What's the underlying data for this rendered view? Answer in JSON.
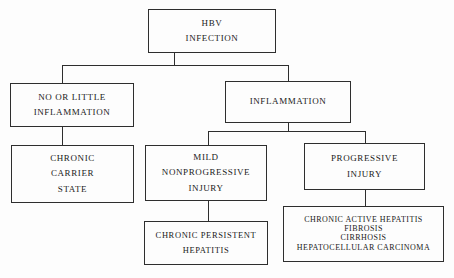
{
  "diagram": {
    "stroke_color": "#2e2e2e",
    "background_color": "#fdfdfd",
    "nodes": {
      "root": {
        "lines": [
          "HBV",
          "INFECTION"
        ]
      },
      "no_or_little_inflammation": {
        "lines": [
          "NO OR LITTLE",
          "INFLAMMATION"
        ]
      },
      "inflammation": {
        "lines": [
          "INFLAMMATION"
        ]
      },
      "chronic_carrier_state": {
        "lines": [
          "CHRONIC",
          "CARRIER",
          "STATE"
        ]
      },
      "mild_nonprogressive_injury": {
        "lines": [
          "MILD",
          "NONPROGRESSIVE",
          "INJURY"
        ]
      },
      "progressive_injury": {
        "lines": [
          "PROGRESSIVE",
          "INJURY"
        ]
      },
      "chronic_persistent_hepatitis": {
        "lines": [
          "CHRONIC PERSISTENT",
          "HEPATITIS"
        ]
      },
      "progressive_outcomes": {
        "lines": [
          "CHRONIC ACTIVE HEPATITIS",
          "FIBROSIS",
          "CIRRHOSIS",
          "HEPATOCELLULAR CARCINOMA"
        ]
      }
    }
  }
}
